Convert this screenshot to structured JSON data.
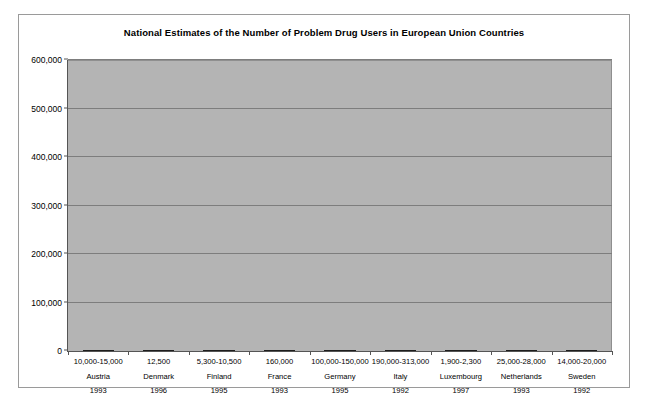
{
  "chart_data": {
    "type": "bar",
    "title": "National Estimates of the Number of Problem Drug Users in European Union Countries",
    "xlabel": "",
    "ylabel": "",
    "ylim": [
      0,
      600000
    ],
    "ytick_labels": [
      "0",
      "100,000",
      "200,000",
      "300,000",
      "400,000",
      "500,000",
      "600,000"
    ],
    "ytick_values": [
      0,
      100000,
      200000,
      300000,
      400000,
      500000,
      600000
    ],
    "grid": true,
    "legend": "none",
    "stacked": true,
    "categories": [
      "Austria",
      "Denmark",
      "Finland",
      "France",
      "Germany",
      "Italy",
      "Luxembourg",
      "Netherlands",
      "Sweden"
    ],
    "estimate_labels": [
      "10,000-15,000",
      "12,500",
      "5,300-10,500",
      "160,000",
      "100,000-150,000",
      "190,000-313,000",
      "1,900-2,300",
      "25,000-28,000",
      "14,000-20,000"
    ],
    "years": [
      "1993",
      "1996",
      "1995",
      "1993",
      "1995",
      "1992",
      "1997",
      "1993",
      "1992"
    ],
    "series": [
      {
        "name": "Low estimate",
        "color": "#b9b9b9",
        "values": [
          10000,
          12500,
          5300,
          160000,
          100000,
          190000,
          1900,
          25000,
          14000
        ]
      },
      {
        "name": "Upper range increment",
        "color": "#5f5f5f",
        "values": [
          5000,
          0,
          5200,
          0,
          145000,
          310000,
          400,
          3000,
          6000
        ]
      }
    ],
    "bars": [
      {
        "country": "Austria",
        "estimate": "10,000-15,000",
        "year": "1993",
        "low": 10000,
        "high": 15000
      },
      {
        "country": "Denmark",
        "estimate": "12,500",
        "year": "1996",
        "low": 12500,
        "high": 12500
      },
      {
        "country": "Finland",
        "estimate": "5,300-10,500",
        "year": "1995",
        "low": 5300,
        "high": 10500
      },
      {
        "country": "France",
        "estimate": "160,000",
        "year": "1993",
        "low": 160000,
        "high": 160000
      },
      {
        "country": "Germany",
        "estimate": "100,000-150,000",
        "year": "1995",
        "low": 100000,
        "high": 245000
      },
      {
        "country": "Italy",
        "estimate": "190,000-313,000",
        "year": "1992",
        "low": 190000,
        "high": 500000
      },
      {
        "country": "Luxembourg",
        "estimate": "1,900-2,300",
        "year": "1997",
        "low": 1900,
        "high": 2300
      },
      {
        "country": "Netherlands",
        "estimate": "25,000-28,000",
        "year": "1993",
        "low": 25000,
        "high": 47000
      },
      {
        "country": "Sweden",
        "estimate": "14,000-20,000",
        "year": "1992",
        "low": 14000,
        "high": 27000
      }
    ]
  }
}
